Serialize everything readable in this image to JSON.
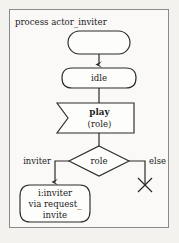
{
  "diagram": {
    "type": "sdl-process-flow",
    "title": "process actor_inviter",
    "frame": {
      "border_color": "#8a8a8a",
      "background": "#faf9f7"
    },
    "page_background": "#f4f2ee",
    "stroke_color": "#2b2b2b",
    "nodes": [
      {
        "id": "start",
        "kind": "start-rounded-rect",
        "label": ""
      },
      {
        "id": "idle",
        "kind": "state",
        "label": "idle"
      },
      {
        "id": "play",
        "kind": "input-signal",
        "label_primary": "play",
        "label_secondary": "(role)"
      },
      {
        "id": "role",
        "kind": "decision-diamond",
        "label": "role"
      },
      {
        "id": "task",
        "kind": "state",
        "line1": "i:inviter",
        "line2": "via request_",
        "line3": "invite"
      },
      {
        "id": "stop",
        "kind": "termination-x",
        "label": ""
      }
    ],
    "edges": [
      {
        "from": "start",
        "to": "idle",
        "label": "",
        "arrow": true
      },
      {
        "from": "idle",
        "to": "play",
        "label": "",
        "arrow": false
      },
      {
        "from": "play",
        "to": "role",
        "label": "",
        "arrow": false
      },
      {
        "from": "role",
        "to": "task",
        "label": "inviter",
        "arrow": true
      },
      {
        "from": "role",
        "to": "stop",
        "label": "else",
        "arrow": false
      }
    ]
  }
}
